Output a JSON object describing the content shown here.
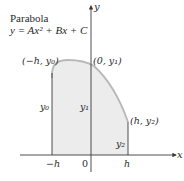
{
  "title": {
    "line1": "Parabola",
    "equation": "y = Ax² + Bx + C"
  },
  "axes": {
    "x_label": "x",
    "y_label": "y",
    "ticks": {
      "minus_h": "−h",
      "zero": "0",
      "h": "h"
    }
  },
  "points": {
    "left": "(−h, y₀)",
    "middle": "(0, y₁)",
    "right": "(h, y₂)"
  },
  "ordinates": {
    "y0": "y₀",
    "y1": "y₁",
    "y2": "y₂"
  },
  "colors": {
    "fill": "#ececec",
    "curve": "#b8b8b8",
    "lines": "#3a3a3a"
  }
}
